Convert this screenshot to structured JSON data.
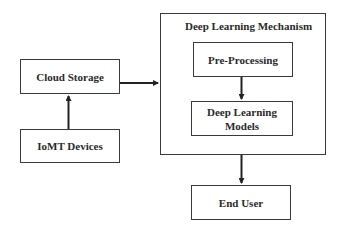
{
  "diagram": {
    "nodes": {
      "cloud_storage": "Cloud Storage",
      "iomt_devices": "IoMT Devices",
      "mechanism_title": "Deep Learning Mechanism",
      "pre_processing": "Pre-Processing",
      "dl_models_line1": "Deep Learning",
      "dl_models_line2": "Models",
      "end_user": "End User"
    },
    "edges": [
      {
        "from": "IoMT Devices",
        "to": "Cloud Storage"
      },
      {
        "from": "Cloud Storage",
        "to": "Deep Learning Mechanism"
      },
      {
        "from": "Pre-Processing",
        "to": "Deep Learning Models"
      },
      {
        "from": "Deep Learning Mechanism",
        "to": "End User"
      }
    ],
    "colors": {
      "stroke": "#3a3a3a",
      "text": "#2a2a2a",
      "background": "#ffffff"
    }
  }
}
